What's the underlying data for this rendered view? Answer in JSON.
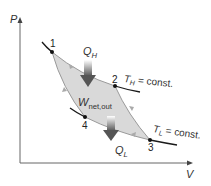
{
  "axes": {
    "y_label": "P",
    "x_label": "V"
  },
  "points": [
    {
      "id": "1",
      "label": "1"
    },
    {
      "id": "2",
      "label": "2"
    },
    {
      "id": "3",
      "label": "3"
    },
    {
      "id": "4",
      "label": "4"
    }
  ],
  "heat_in": {
    "symbol": "Q",
    "subscript": "H"
  },
  "heat_out": {
    "symbol": "Q",
    "subscript": "L"
  },
  "work": {
    "symbol": "W",
    "subscript": "net,out"
  },
  "isotherm_high": {
    "symbol": "T",
    "subscript": "H",
    "suffix": "= const."
  },
  "isotherm_low": {
    "symbol": "T",
    "subscript": "L",
    "suffix": "= const."
  },
  "colors": {
    "cycle_fill": "#d9d9d9",
    "cycle_edge": "#9a9a9a",
    "curve": "#1a1a1a",
    "axis": "#555555",
    "arrow_dark": "#5a5a5a",
    "arrow_light": "#ffffff"
  }
}
